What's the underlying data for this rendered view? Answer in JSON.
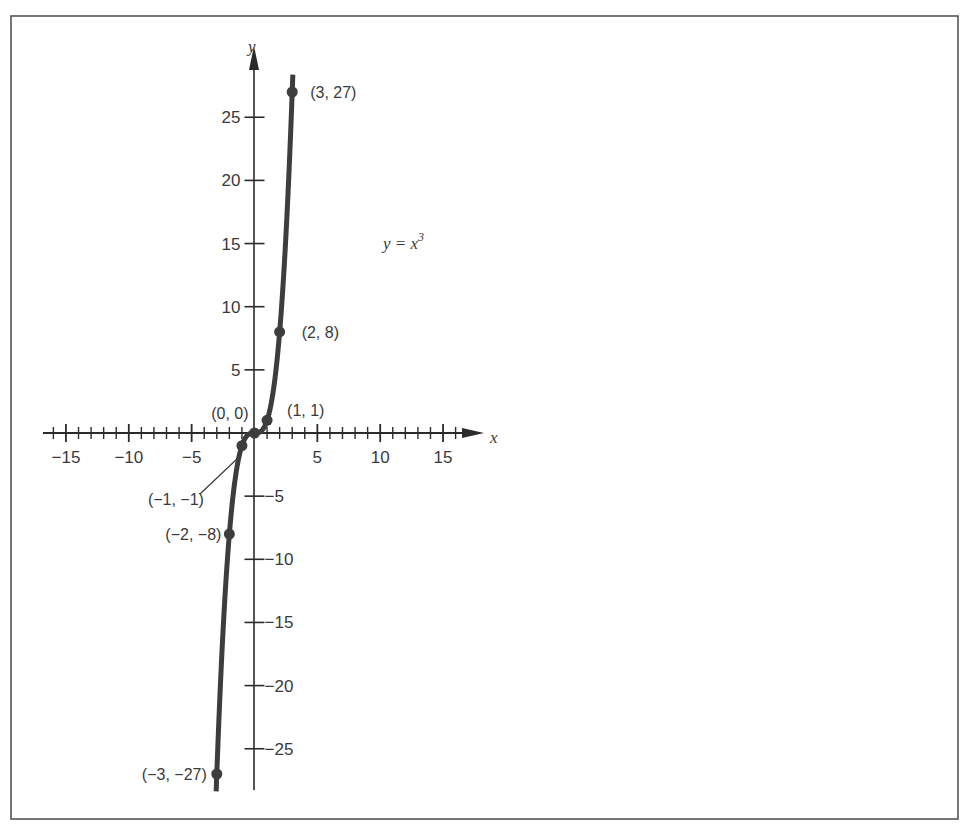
{
  "header_fragment": "Figure continued from previous page — graph of y = x³",
  "chart_data": {
    "type": "line",
    "title": "",
    "equation_label": "y = x",
    "equation_exponent": "3",
    "xlabel": "x",
    "ylabel": "y",
    "xlim": [
      -16.5,
      17
    ],
    "ylim": [
      -28.5,
      28.5
    ],
    "grid": false,
    "x_ticks_major": [
      -15,
      -10,
      -5,
      5,
      10,
      15
    ],
    "x_tick_labels": [
      "−15",
      "−10",
      "−5",
      "5",
      "10",
      "15"
    ],
    "y_ticks_major": [
      25,
      20,
      15,
      10,
      5,
      -5,
      -10,
      -15,
      -20,
      -25
    ],
    "y_tick_labels": [
      "25",
      "20",
      "15",
      "10",
      "5",
      "−5",
      "−10",
      "−15",
      "−20",
      "−25"
    ],
    "x_minor_step": 1,
    "series": [
      {
        "name": "y = x^3",
        "function": "x^3",
        "x_range": [
          -3.05,
          3.05
        ],
        "color": "#3d3d3d"
      }
    ],
    "points": [
      {
        "x": 3,
        "y": 27,
        "label": "(3, 27)"
      },
      {
        "x": 2,
        "y": 8,
        "label": "(2, 8)"
      },
      {
        "x": 1,
        "y": 1,
        "label": "(1, 1)"
      },
      {
        "x": 0,
        "y": 0,
        "label": "(0, 0)"
      },
      {
        "x": -1,
        "y": -1,
        "label": "(−1, −1)"
      },
      {
        "x": -2,
        "y": -8,
        "label": "(−2, −8)"
      },
      {
        "x": -3,
        "y": -27,
        "label": "(−3, −27)"
      }
    ]
  },
  "colors": {
    "axis": "#2b2b2b",
    "curve": "#3d3d3d",
    "frame": "#555555",
    "text": "#3a3a3a"
  }
}
